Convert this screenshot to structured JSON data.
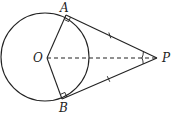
{
  "diagram": {
    "type": "geometry",
    "colors": {
      "stroke": "#222222",
      "background": "#ffffff"
    },
    "points": {
      "O": {
        "label": "O",
        "x": 47,
        "y": 58
      },
      "A": {
        "label": "A",
        "x": 66,
        "y": 15
      },
      "B": {
        "label": "B",
        "x": 62,
        "y": 99
      },
      "P": {
        "label": "P",
        "x": 157,
        "y": 58
      }
    },
    "circle": {
      "center": "O",
      "cx": 45,
      "cy": 57,
      "r": 44
    },
    "segments": [
      {
        "from": "O",
        "to": "A",
        "style": "solid"
      },
      {
        "from": "O",
        "to": "B",
        "style": "solid"
      },
      {
        "from": "A",
        "to": "P",
        "style": "solid",
        "tick_marks": 1
      },
      {
        "from": "B",
        "to": "P",
        "style": "solid",
        "tick_marks": 1
      },
      {
        "from": "O",
        "to": "P",
        "style": "dashed"
      }
    ],
    "right_angles": [
      "OAP",
      "OBP"
    ],
    "equal_angles": [
      "APO",
      "BPO"
    ]
  }
}
